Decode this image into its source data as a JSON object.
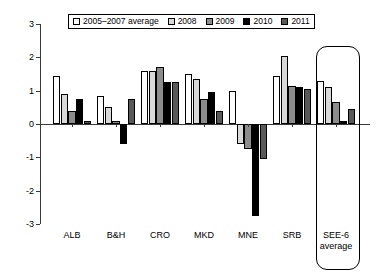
{
  "chart_data": {
    "type": "bar",
    "title": "",
    "subtitle": "",
    "xlabel": "",
    "ylabel": "",
    "ylim": [
      -3,
      3
    ],
    "yticks": [
      3,
      2,
      1,
      0,
      -1,
      -2,
      -3
    ],
    "ytick_labels": [
      "3",
      "2",
      "1",
      "0",
      "-1",
      "-2",
      "-3"
    ],
    "grid": false,
    "legend_position": "top",
    "zero_line": true,
    "categories": [
      "ALB",
      "B&H",
      "CRO",
      "MKD",
      "MNE",
      "SRB",
      "SEE-6 average"
    ],
    "series": [
      {
        "name": "2005-2007 average",
        "color": "#ffffff",
        "values": [
          1.45,
          0.85,
          1.6,
          1.5,
          1.0,
          1.45,
          1.3
        ]
      },
      {
        "name": "2008",
        "color": "#d9d9d9",
        "values": [
          0.9,
          0.5,
          1.6,
          1.35,
          -0.6,
          2.05,
          1.1
        ]
      },
      {
        "name": "2009",
        "color": "#8c8c8c",
        "values": [
          0.4,
          0.1,
          1.7,
          0.75,
          -0.75,
          1.15,
          0.65
        ]
      },
      {
        "name": "2010",
        "color": "#000000",
        "values": [
          0.75,
          -0.6,
          1.25,
          0.95,
          -2.75,
          1.1,
          0.1
        ]
      },
      {
        "name": "2011",
        "color": "#595959",
        "values": [
          0.1,
          0.75,
          1.25,
          0.4,
          -1.05,
          1.05,
          0.45
        ]
      }
    ],
    "annotations": [
      {
        "name": "see6-highlight-box",
        "shape": "rounded-rectangle",
        "target": "SEE-6 average"
      }
    ]
  },
  "legend": {
    "items": [
      {
        "label": "2005–2007 average",
        "color": "#ffffff"
      },
      {
        "label": "2008",
        "color": "#d9d9d9"
      },
      {
        "label": "2009",
        "color": "#8c8c8c"
      },
      {
        "label": "2010",
        "color": "#000000"
      },
      {
        "label": "2011",
        "color": "#595959"
      }
    ]
  },
  "axis": {
    "y_tick_labels": [
      "3",
      "2",
      "1",
      "0",
      "-1",
      "-2",
      "-3"
    ]
  },
  "groups": [
    {
      "label": "ALB",
      "label2": ""
    },
    {
      "label": "B&H",
      "label2": ""
    },
    {
      "label": "CRO",
      "label2": ""
    },
    {
      "label": "MKD",
      "label2": ""
    },
    {
      "label": "MNE",
      "label2": ""
    },
    {
      "label": "SRB",
      "label2": ""
    },
    {
      "label": "SEE-6",
      "label2": "average"
    }
  ]
}
